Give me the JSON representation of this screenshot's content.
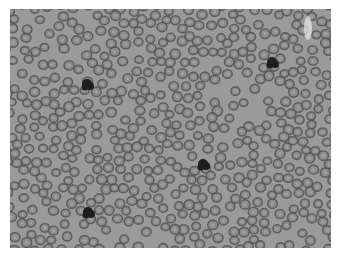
{
  "image": {
    "subject": "Peripheral blood smear micrograph (grayscale)",
    "background_color": "#9a9a9a",
    "rbc_fill": "#8a8a8a",
    "rbc_rim": "#555555",
    "rbc_center": "#a4a4a4",
    "wbc_color": "#1e1e1e",
    "wbc_cells": [
      {
        "x": 87,
        "y": 84
      },
      {
        "x": 272,
        "y": 62
      },
      {
        "x": 203,
        "y": 164
      },
      {
        "x": 88,
        "y": 212
      }
    ],
    "glare": {
      "x": 308,
      "y": 28
    }
  }
}
